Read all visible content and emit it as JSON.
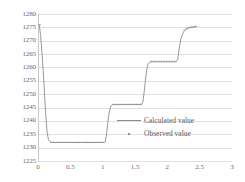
{
  "chart_data": {
    "type": "line",
    "title": "",
    "xlabel": "",
    "ylabel": "",
    "xlim": [
      0,
      3
    ],
    "ylim": [
      1225,
      1280
    ],
    "grid": "horizontal",
    "legend_position": "bottom-right-inside",
    "x_ticks": [
      "0",
      "0.5",
      "1",
      "1.5",
      "2",
      "2.5",
      "3"
    ],
    "x_tick_values": [
      0,
      0.5,
      1,
      1.5,
      2,
      2.5,
      3
    ],
    "y_ticks": [
      "1280",
      "1275",
      "1270",
      "1265",
      "1260",
      "1255",
      "1250",
      "1245",
      "1240",
      "1235",
      "1230",
      "1225"
    ],
    "y_tick_values": [
      1280,
      1275,
      1270,
      1265,
      1260,
      1255,
      1250,
      1245,
      1240,
      1235,
      1230,
      1225
    ],
    "series": [
      {
        "name": "Calculated value",
        "style": "line",
        "color": "#8d8d8d",
        "points": [
          [
            0.0,
            1276.2
          ],
          [
            0.02,
            1275.8
          ],
          [
            0.04,
            1272.0
          ],
          [
            0.06,
            1266.0
          ],
          [
            0.08,
            1259.0
          ],
          [
            0.1,
            1250.5
          ],
          [
            0.12,
            1242.0
          ],
          [
            0.14,
            1236.0
          ],
          [
            0.16,
            1233.2
          ],
          [
            0.18,
            1232.3
          ],
          [
            0.2,
            1232.0
          ],
          [
            0.25,
            1231.9
          ],
          [
            0.35,
            1231.9
          ],
          [
            0.5,
            1231.9
          ],
          [
            0.7,
            1231.9
          ],
          [
            0.9,
            1231.9
          ],
          [
            1.02,
            1231.9
          ],
          [
            1.04,
            1232.2
          ],
          [
            1.06,
            1235.0
          ],
          [
            1.08,
            1239.5
          ],
          [
            1.1,
            1243.0
          ],
          [
            1.12,
            1245.2
          ],
          [
            1.14,
            1245.9
          ],
          [
            1.16,
            1246.1
          ],
          [
            1.25,
            1246.1
          ],
          [
            1.4,
            1246.1
          ],
          [
            1.55,
            1246.1
          ],
          [
            1.6,
            1246.1
          ],
          [
            1.62,
            1247.0
          ],
          [
            1.64,
            1250.5
          ],
          [
            1.66,
            1255.0
          ],
          [
            1.68,
            1259.0
          ],
          [
            1.7,
            1261.2
          ],
          [
            1.72,
            1261.9
          ],
          [
            1.74,
            1262.1
          ],
          [
            1.85,
            1262.1
          ],
          [
            2.0,
            1262.1
          ],
          [
            2.1,
            1262.1
          ],
          [
            2.14,
            1262.1
          ],
          [
            2.16,
            1263.0
          ],
          [
            2.18,
            1266.5
          ],
          [
            2.2,
            1269.5
          ],
          [
            2.22,
            1271.5
          ],
          [
            2.24,
            1272.8
          ],
          [
            2.26,
            1273.6
          ],
          [
            2.28,
            1274.1
          ],
          [
            2.3,
            1274.4
          ],
          [
            2.33,
            1274.7
          ],
          [
            2.36,
            1274.9
          ],
          [
            2.39,
            1275.0
          ],
          [
            2.42,
            1275.1
          ],
          [
            2.45,
            1275.2
          ]
        ]
      },
      {
        "name": "Observed value",
        "style": "markers",
        "color": "#8d8d8d",
        "points": [
          [
            0.03,
            1276.0
          ],
          [
            0.2,
            1232.0
          ],
          [
            0.24,
            1232.0
          ],
          [
            0.28,
            1232.0
          ],
          [
            0.32,
            1232.0
          ],
          [
            0.36,
            1232.0
          ],
          [
            0.4,
            1232.0
          ],
          [
            0.44,
            1232.0
          ],
          [
            0.48,
            1232.0
          ],
          [
            0.52,
            1232.0
          ],
          [
            0.56,
            1232.0
          ],
          [
            0.6,
            1232.0
          ],
          [
            0.64,
            1232.0
          ],
          [
            0.68,
            1232.0
          ],
          [
            0.72,
            1232.0
          ],
          [
            0.76,
            1232.0
          ],
          [
            0.8,
            1232.0
          ],
          [
            0.84,
            1232.0
          ],
          [
            0.88,
            1232.0
          ],
          [
            0.92,
            1232.0
          ],
          [
            0.96,
            1232.0
          ],
          [
            1.0,
            1232.0
          ],
          [
            1.16,
            1246.2
          ],
          [
            1.2,
            1246.2
          ],
          [
            1.24,
            1246.2
          ],
          [
            1.28,
            1246.2
          ],
          [
            1.32,
            1246.2
          ],
          [
            1.36,
            1246.2
          ],
          [
            1.4,
            1246.2
          ],
          [
            1.44,
            1246.2
          ],
          [
            1.48,
            1246.2
          ],
          [
            1.52,
            1246.2
          ],
          [
            1.56,
            1246.2
          ],
          [
            1.59,
            1246.2
          ],
          [
            1.75,
            1262.3
          ],
          [
            1.79,
            1262.3
          ],
          [
            1.83,
            1262.3
          ],
          [
            1.87,
            1262.3
          ],
          [
            1.91,
            1262.3
          ],
          [
            1.95,
            1262.3
          ],
          [
            1.99,
            1262.3
          ],
          [
            2.03,
            1262.3
          ],
          [
            2.07,
            1262.3
          ],
          [
            2.11,
            1262.3
          ],
          [
            2.26,
            1273.9
          ],
          [
            2.29,
            1274.4
          ],
          [
            2.32,
            1274.8
          ],
          [
            2.35,
            1275.1
          ],
          [
            2.38,
            1275.2
          ],
          [
            2.41,
            1275.3
          ],
          [
            2.44,
            1275.4
          ]
        ]
      }
    ]
  },
  "legend": {
    "entries": [
      {
        "label": "Calculated value",
        "marker": "line"
      },
      {
        "label": "Observed value",
        "marker": "dot"
      }
    ]
  },
  "colors": {
    "series": "#8d8d8d",
    "gridline": "#e0e0e0",
    "axis": "#c9c9c9",
    "tick_text": "#6b6b6b"
  }
}
